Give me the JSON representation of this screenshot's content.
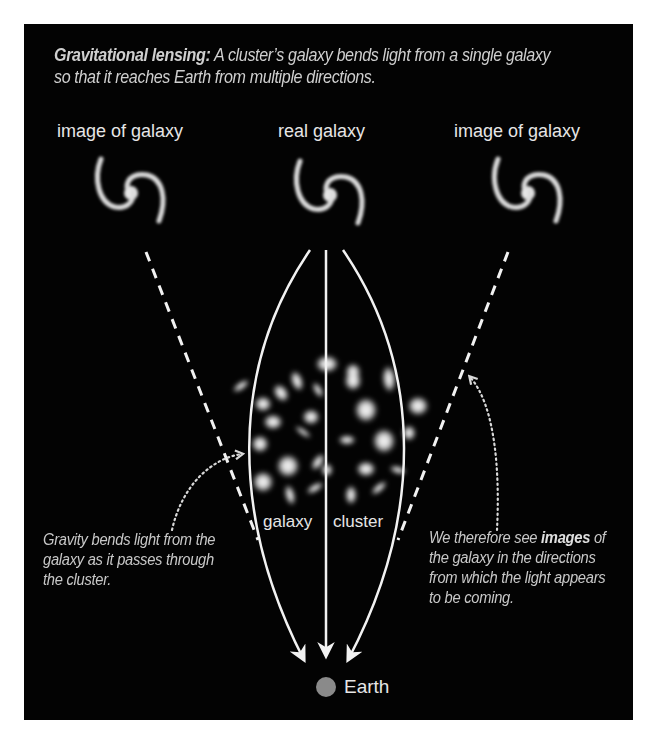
{
  "header": {
    "title_bold": "Gravitational lensing:",
    "title_rest": " A cluster’s galaxy bends light from a single galaxy so that it reaches Earth from multiple directions."
  },
  "galaxies": [
    {
      "label": "image of galaxy",
      "role": "left-image"
    },
    {
      "label": "real galaxy",
      "role": "source"
    },
    {
      "label": "image of galaxy",
      "role": "right-image"
    }
  ],
  "cluster": {
    "label_left": "galaxy",
    "label_right": "cluster"
  },
  "notes": {
    "left": "Gravity bends light from the galaxy as it passes through the cluster.",
    "right_pre": "We therefore see ",
    "right_bold": "images",
    "right_post": " of the galaxy in the directions from which the light appears to be coming."
  },
  "earth": {
    "label": "Earth",
    "color": "#8a8a8a"
  },
  "colors": {
    "background": "#030303",
    "line": "#f2f2f2",
    "text": "#d0d0d0"
  }
}
